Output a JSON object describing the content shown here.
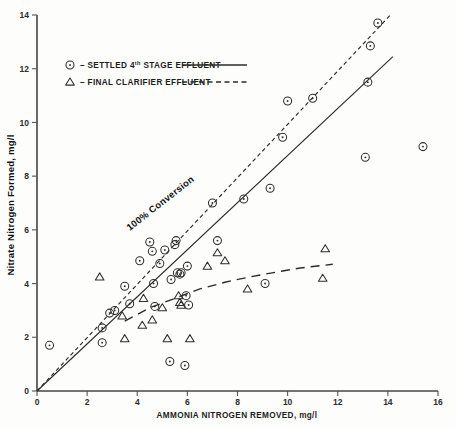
{
  "chart_data": {
    "type": "scatter",
    "title": "",
    "xlabel": "AMMONIA NITROGEN REMOVED, mg/l",
    "ylabel": "Nitrate Nitrogen Formed, mg/l",
    "xlim": [
      0,
      16
    ],
    "ylim": [
      0,
      14
    ],
    "xticks": [
      0,
      2,
      4,
      6,
      8,
      10,
      12,
      14,
      16
    ],
    "yticks": [
      0,
      2,
      4,
      6,
      8,
      10,
      12,
      14
    ],
    "grid": false,
    "legend_position": "upper-left",
    "annotations": [
      {
        "name": "conversion-label",
        "text": "100% Conversion",
        "x": 5.0,
        "y": 6.9,
        "rotation": -38
      }
    ],
    "series": [
      {
        "name": "SETTLED 4th STAGE EFFLUENT",
        "marker": "circle-dot",
        "line_style": "solid",
        "points": [
          [
            0.5,
            1.7
          ],
          [
            2.6,
            1.8
          ],
          [
            2.6,
            2.35
          ],
          [
            2.9,
            2.9
          ],
          [
            3.1,
            3.0
          ],
          [
            3.5,
            3.9
          ],
          [
            3.7,
            3.25
          ],
          [
            4.1,
            4.85
          ],
          [
            4.5,
            5.55
          ],
          [
            4.6,
            5.2
          ],
          [
            4.65,
            4.0
          ],
          [
            4.7,
            3.15
          ],
          [
            4.9,
            4.75
          ],
          [
            5.1,
            5.25
          ],
          [
            5.3,
            1.1
          ],
          [
            5.35,
            4.15
          ],
          [
            5.5,
            5.45
          ],
          [
            5.55,
            5.6
          ],
          [
            5.6,
            4.4
          ],
          [
            5.7,
            4.35
          ],
          [
            5.75,
            4.4
          ],
          [
            5.9,
            0.95
          ],
          [
            5.95,
            3.55
          ],
          [
            6.0,
            4.65
          ],
          [
            6.05,
            3.2
          ],
          [
            7.0,
            7.0
          ],
          [
            7.2,
            5.6
          ],
          [
            8.25,
            7.15
          ],
          [
            9.1,
            4.0
          ],
          [
            9.3,
            7.55
          ],
          [
            9.8,
            9.45
          ],
          [
            10.0,
            10.8
          ],
          [
            11.0,
            10.9
          ],
          [
            13.1,
            8.7
          ],
          [
            13.2,
            11.5
          ],
          [
            13.3,
            12.85
          ],
          [
            13.6,
            13.7
          ],
          [
            15.4,
            9.1
          ]
        ],
        "fit_line": {
          "x1": 0.0,
          "y1": 0.0,
          "x2": 14.2,
          "y2": 12.45
        }
      },
      {
        "name": "FINAL CLARIFIER EFFLUENT",
        "marker": "triangle",
        "line_style": "dashed",
        "points": [
          [
            2.5,
            4.25
          ],
          [
            3.4,
            2.8
          ],
          [
            3.5,
            1.95
          ],
          [
            4.2,
            2.45
          ],
          [
            4.25,
            3.45
          ],
          [
            4.6,
            2.65
          ],
          [
            5.0,
            3.1
          ],
          [
            5.2,
            1.95
          ],
          [
            5.65,
            3.55
          ],
          [
            5.7,
            3.3
          ],
          [
            5.75,
            3.2
          ],
          [
            6.1,
            1.95
          ],
          [
            6.8,
            4.65
          ],
          [
            7.2,
            5.15
          ],
          [
            7.5,
            4.85
          ],
          [
            8.4,
            3.8
          ],
          [
            11.4,
            4.2
          ],
          [
            11.5,
            5.3
          ]
        ],
        "fit_curve": [
          [
            3.5,
            2.6
          ],
          [
            4.5,
            3.1
          ],
          [
            5.5,
            3.45
          ],
          [
            6.5,
            3.8
          ],
          [
            7.5,
            4.05
          ],
          [
            8.5,
            4.25
          ],
          [
            9.5,
            4.42
          ],
          [
            10.5,
            4.58
          ],
          [
            11.8,
            4.72
          ]
        ]
      }
    ],
    "reference_line": {
      "name": "100% Conversion",
      "style": "dashed-fine",
      "x1": 0.0,
      "y1": 0.0,
      "x2": 14.1,
      "y2": 14.0
    }
  },
  "legend": {
    "entries": [
      {
        "dash": "–",
        "label_main": "SETTLED 4",
        "label_sup": "th",
        "label_rest": " STAGE EFFLUENT",
        "marker": "circle-dot",
        "rule": "solid"
      },
      {
        "dash": "–",
        "label_main": "FINAL CLARIFIER EFFLUENT",
        "label_sup": "",
        "label_rest": "",
        "marker": "triangle",
        "rule": "dashed"
      }
    ]
  },
  "colors": {
    "ink": "#2b2b2b",
    "background": "#fdfdfc",
    "axis": "#444444"
  }
}
